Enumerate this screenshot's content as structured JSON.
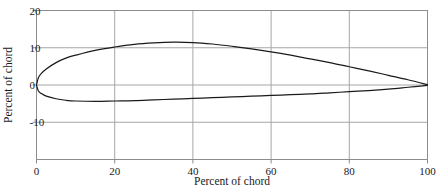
{
  "chart_data": {
    "type": "line",
    "title": "",
    "subtitle": "",
    "xlabel": "Percent of chord",
    "ylabel": "Percent of chord",
    "xlim": [
      0,
      100
    ],
    "ylim": [
      -20,
      20
    ],
    "xticks": [
      0,
      20,
      40,
      60,
      80,
      100
    ],
    "yticks": [
      -10,
      0,
      10,
      20
    ],
    "xtick_labels": [
      "0",
      "20",
      "40",
      "60",
      "80",
      "100"
    ],
    "ytick_labels": [
      "-10",
      "0",
      "10",
      "20"
    ],
    "grid": true,
    "grid_color": "#a6a6a6",
    "frame_color": "#8c8c8c",
    "line_color": "#1a1a1a",
    "legend": null,
    "series": [
      {
        "name": "Upper surface",
        "x": [
          0,
          0.5,
          1.25,
          2.5,
          5,
          7.5,
          10,
          15,
          20,
          25,
          30,
          35,
          40,
          45,
          50,
          55,
          60,
          65,
          70,
          75,
          80,
          85,
          90,
          95,
          100
        ],
        "y": [
          0,
          2.0,
          3.1,
          4.3,
          6.0,
          7.2,
          8.0,
          9.3,
          10.2,
          10.9,
          11.3,
          11.5,
          11.4,
          11.0,
          10.4,
          9.7,
          8.9,
          8.0,
          7.0,
          6.0,
          4.9,
          3.8,
          2.6,
          1.4,
          0.1
        ],
        "color": "#1a1a1a"
      },
      {
        "name": "Lower surface",
        "x": [
          0,
          0.5,
          1.25,
          2.5,
          5,
          7.5,
          10,
          15,
          20,
          25,
          30,
          35,
          40,
          45,
          50,
          55,
          60,
          65,
          70,
          75,
          80,
          85,
          90,
          95,
          100
        ],
        "y": [
          0,
          -1.6,
          -2.3,
          -3.0,
          -3.7,
          -4.1,
          -4.3,
          -4.4,
          -4.3,
          -4.2,
          -4.0,
          -3.8,
          -3.6,
          -3.4,
          -3.2,
          -3.0,
          -2.8,
          -2.6,
          -2.4,
          -2.1,
          -1.8,
          -1.5,
          -1.1,
          -0.6,
          -0.1
        ],
        "color": "#1a1a1a"
      }
    ]
  },
  "figure": {
    "caption": "",
    "note": ""
  }
}
